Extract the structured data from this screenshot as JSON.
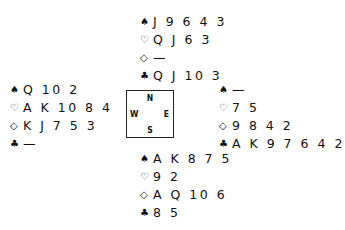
{
  "suit_symbols": {
    "spades": "♠",
    "hearts": "♡",
    "diamonds": "◇",
    "clubs": "♣"
  },
  "hands": {
    "north": {
      "spades": "J 9 6 4 3",
      "hearts": "Q J 6 3",
      "diamonds": "—",
      "clubs": "Q J 10 3"
    },
    "west": {
      "spades": "Q 10 2",
      "hearts": "A K 10 8 4",
      "diamonds": "K J 7 5 3",
      "clubs": "—"
    },
    "east": {
      "spades": "—",
      "hearts": "7 5",
      "diamonds": "9 8 4 2",
      "clubs": "A K 9 7 6 4 2"
    },
    "south": {
      "spades": "A K 8 7 5",
      "hearts": "9 2",
      "diamonds": "A Q 10 6",
      "clubs": "8 5"
    }
  },
  "compass": {
    "n": "N",
    "s": "S",
    "w": "W",
    "e": "E"
  }
}
